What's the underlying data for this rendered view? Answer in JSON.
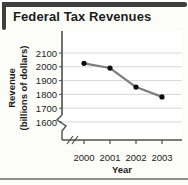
{
  "title": "Federal Tax Revenues",
  "colors": {
    "text": "#1c1c1c",
    "bracket": "#3f3f3f",
    "rule": "#8e8e8e",
    "axis": "#4f4f4f",
    "grid": "#d8d8d5",
    "line": "#7d7d7d",
    "point": "#0d0d0d",
    "plot_bg": "#ffffff"
  },
  "chart_data": {
    "type": "line",
    "title": "Federal Tax Revenues",
    "x": [
      2000,
      2001,
      2002,
      2003
    ],
    "values": [
      2025,
      1991,
      1853,
      1782
    ],
    "xlabel": "Year",
    "ylabel": "Revenue (billions of dollars)",
    "ylabel_lines": [
      "Revenue",
      "(billions of dollars)"
    ],
    "yticks": [
      1600,
      1700,
      1800,
      1900,
      2000,
      2100
    ],
    "ylim": [
      1600,
      2100
    ],
    "axis_break": true,
    "grid": "horizontal",
    "legend": "none"
  }
}
